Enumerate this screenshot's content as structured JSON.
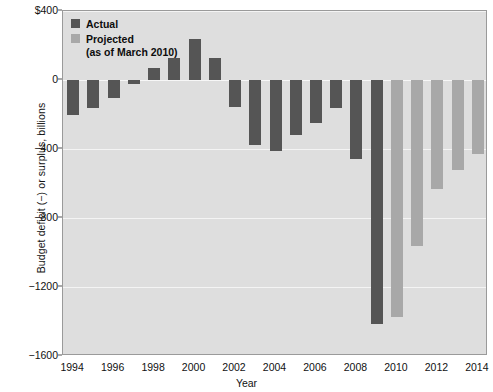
{
  "chart_data": {
    "type": "bar",
    "title": "",
    "xlabel": "Year",
    "ylabel": "Budget deficit (−) or surplus, billions",
    "ylim": [
      -1600,
      400
    ],
    "ytick_labels": [
      "$400",
      "0",
      "−400",
      "−800",
      "−1200",
      "−1600"
    ],
    "ytick_values": [
      400,
      0,
      -400,
      -800,
      -1200,
      -1600
    ],
    "xtick_labels": [
      "1994",
      "1996",
      "1998",
      "2000",
      "2002",
      "2004",
      "2006",
      "2008",
      "2010",
      "2012",
      "2014"
    ],
    "xtick_values": [
      1994,
      1996,
      1998,
      2000,
      2002,
      2004,
      2006,
      2008,
      2010,
      2012,
      2014
    ],
    "grid": true,
    "legend_position": "top-left",
    "categories": [
      1994,
      1995,
      1996,
      1997,
      1998,
      1999,
      2000,
      2001,
      2002,
      2003,
      2004,
      2005,
      2006,
      2007,
      2008,
      2009,
      2010,
      2011,
      2012,
      2013,
      2014
    ],
    "series": [
      {
        "name": "Actual",
        "color": "#555555",
        "values": [
          -203,
          -164,
          -107,
          -22,
          69,
          126,
          236,
          128,
          -158,
          -378,
          -413,
          -318,
          -248,
          -161,
          -459,
          -1413,
          null,
          null,
          null,
          null,
          null
        ]
      },
      {
        "name": "Projected",
        "color": "#a8a8a8",
        "values": [
          null,
          null,
          null,
          null,
          null,
          null,
          null,
          null,
          null,
          null,
          null,
          null,
          null,
          null,
          null,
          null,
          -1376,
          -965,
          -630,
          -520,
          -430
        ]
      }
    ]
  },
  "legend": {
    "actual_label": "Actual",
    "projected_label": "Projected",
    "projected_note": "(as of March 2010)"
  },
  "colors": {
    "actual": "#555555",
    "projected": "#a8a8a8",
    "plot_background": "#dedede",
    "gridline": "#f4f4f4",
    "frame": "#9a9a9a"
  }
}
